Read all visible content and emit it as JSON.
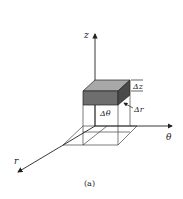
{
  "figure": {
    "caption": "(a)",
    "axes": {
      "z_label": "z",
      "theta_label": "θ",
      "r_label": "r"
    },
    "element_labels": {
      "delta_z": "Δz",
      "delta_r": "Δr",
      "delta_theta": "Δθ"
    },
    "colors": {
      "line": "#333333",
      "top_face": "#a8a8a8",
      "front_face": "#6e6e6e",
      "side_face": "#4a4a4a"
    }
  }
}
